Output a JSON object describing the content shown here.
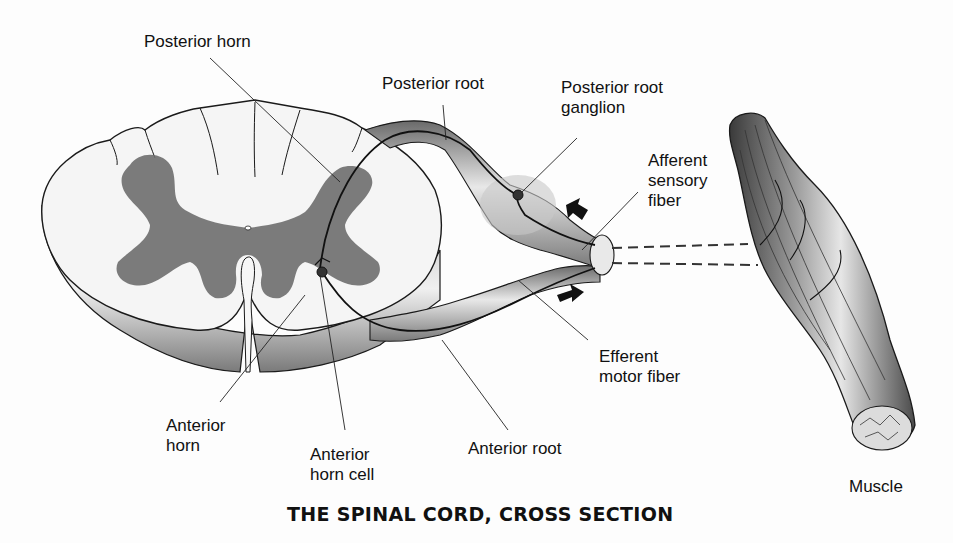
{
  "figure": {
    "title": "THE SPINAL CORD, CROSS SECTION",
    "labels": {
      "posterior_horn": "Posterior horn",
      "posterior_root": "Posterior root",
      "posterior_root_ganglion": "Posterior root\nganglion",
      "afferent_sensory_fiber": "Afferent\nsensory\nfiber",
      "efferent_motor_fiber": "Efferent\nmotor fiber",
      "anterior_root": "Anterior root",
      "anterior_horn": "Anterior\nhorn",
      "anterior_horn_cell": "Anterior\nhorn cell",
      "muscle": "Muscle"
    },
    "colors": {
      "white_matter": "#f4f4f4",
      "gray_matter": "#6e6e6e",
      "outline": "#1a1a1a",
      "shading": "#8a8a8a"
    }
  }
}
